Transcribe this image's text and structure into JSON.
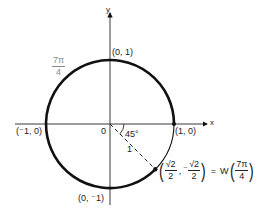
{
  "diagram": {
    "axes": {
      "x_label": "x",
      "y_label": "y",
      "origin_label": "0"
    },
    "points": {
      "top": "(0, 1)",
      "right": "(1, 0)",
      "left": "(⁻1, 0)",
      "bottom": "(0, ⁻1)"
    },
    "arc_label": {
      "numerator": "7π",
      "denominator": "4"
    },
    "angle_label": "45°",
    "radius_label": "1",
    "winding_point": {
      "x_num": "√2",
      "x_den": "2",
      "y_sign": "⁻",
      "y_num": "√2",
      "y_den": "2",
      "equals": "=",
      "func": "W",
      "arg_num": "7π",
      "arg_den": "4"
    },
    "colors": {
      "stroke": "#111111",
      "text": "#222222",
      "label_gray": "#8a8a8a"
    }
  }
}
